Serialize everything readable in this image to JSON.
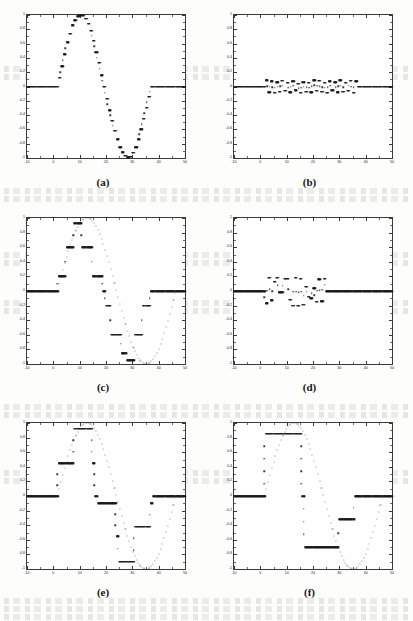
{
  "figure": {
    "kind": "multi-panel-scatter-figure",
    "panel_count": 6,
    "layout": "2 columns x 3 rows",
    "source_look": "scanned journal page, black dots on white"
  },
  "axes_common": {
    "xlabel": "",
    "ylabel": "",
    "xlim": [
      -10,
      50
    ],
    "ylim": [
      -1,
      1
    ],
    "xticks": [
      -10,
      0,
      10,
      20,
      30,
      40,
      50
    ],
    "xtick_labels": [
      "-10",
      "0",
      "10",
      "20",
      "30",
      "40",
      "50"
    ],
    "yticks": [
      1,
      0.8,
      0.6,
      0.4,
      0.2,
      0,
      -0.2,
      -0.4,
      -0.6,
      -0.8,
      -1
    ],
    "ytick_labels": [
      "1",
      "0.8",
      "0.6",
      "0.4",
      "0.2",
      "0",
      "-0.2",
      "-0.4",
      "-0.6",
      "-0.8",
      "-1"
    ],
    "grid": false,
    "legend": null,
    "marker": "dot",
    "marker_color": "#1a1a1a"
  },
  "captions": {
    "a": "(a)",
    "b": "(b)",
    "c": "(c)",
    "d": "(d)",
    "e": "(e)",
    "f": "(f)"
  },
  "chart_data": [
    {
      "id": "a",
      "type": "scatter",
      "title": "(a)",
      "xlabel": "",
      "ylabel": "",
      "xlim": [
        -10,
        50
      ],
      "ylim": [
        -1,
        1
      ],
      "grid": false,
      "description": "finely quantized sine burst, zero outside burst",
      "x": [
        -10,
        -9,
        -8,
        -7,
        -6,
        -5,
        -4,
        -3,
        -2,
        -1,
        0,
        1,
        2,
        3,
        4,
        5,
        6,
        7,
        8,
        9,
        10,
        11,
        12,
        13,
        14,
        15,
        16,
        17,
        18,
        19,
        20,
        21,
        22,
        23,
        24,
        25,
        26,
        27,
        28,
        29,
        30,
        31,
        32,
        33,
        34,
        35,
        36,
        37,
        38,
        39,
        40,
        41,
        42,
        43,
        44,
        45,
        46,
        47,
        48,
        49,
        50
      ],
      "y": [
        0,
        0,
        0,
        0,
        0,
        0,
        0,
        0,
        0,
        0,
        0,
        0,
        0.12,
        0.28,
        0.45,
        0.62,
        0.74,
        0.86,
        0.93,
        0.98,
        1.0,
        0.99,
        0.95,
        0.88,
        0.78,
        0.64,
        0.48,
        0.33,
        0.16,
        0.0,
        -0.17,
        -0.33,
        -0.48,
        -0.62,
        -0.74,
        -0.85,
        -0.92,
        -0.97,
        -0.99,
        -0.98,
        -0.93,
        -0.85,
        -0.74,
        -0.6,
        -0.45,
        -0.3,
        -0.14,
        0,
        0,
        0,
        0,
        0,
        0,
        0,
        0,
        0,
        0,
        0,
        0,
        0,
        0
      ]
    },
    {
      "id": "b",
      "type": "scatter",
      "title": "(b)",
      "xlabel": "",
      "ylabel": "",
      "xlim": [
        -10,
        50
      ],
      "ylim": [
        -1,
        1
      ],
      "grid": false,
      "description": "quantization error for (a): small oscillation within about +/-0.12, zero outside burst",
      "x": [
        -10,
        -9,
        -8,
        -7,
        -6,
        -5,
        -4,
        -3,
        -2,
        -1,
        0,
        1,
        2,
        3,
        4,
        5,
        6,
        7,
        8,
        9,
        10,
        11,
        12,
        13,
        14,
        15,
        16,
        17,
        18,
        19,
        20,
        21,
        22,
        23,
        24,
        25,
        26,
        27,
        28,
        29,
        30,
        31,
        32,
        33,
        34,
        35,
        36,
        37,
        38,
        39,
        40,
        41,
        42,
        43,
        44,
        45,
        46,
        47,
        48,
        49,
        50
      ],
      "y": [
        0,
        0,
        0,
        0,
        0,
        0,
        0,
        0,
        0,
        0,
        0,
        0,
        0.09,
        -0.08,
        0.07,
        -0.09,
        0.06,
        -0.07,
        0.08,
        -0.06,
        0.05,
        -0.08,
        0.07,
        -0.05,
        0.04,
        -0.09,
        0.06,
        -0.07,
        0.05,
        -0.08,
        0.09,
        -0.06,
        0.08,
        -0.07,
        0.05,
        -0.09,
        0.07,
        -0.05,
        0.06,
        -0.08,
        0.09,
        -0.07,
        0.05,
        -0.06,
        0.08,
        -0.09,
        0.07,
        0,
        0,
        0,
        0,
        0,
        0,
        0,
        0,
        0,
        0,
        0,
        0,
        0,
        0
      ]
    },
    {
      "id": "c",
      "type": "scatter",
      "title": "(c)",
      "xlabel": "",
      "ylabel": "",
      "xlim": [
        -10,
        50
      ],
      "ylim": [
        -1,
        1
      ],
      "grid": false,
      "description": "medium quantized sine burst, short flat runs at discrete levels",
      "x": [
        -10,
        -9,
        -8,
        -7,
        -6,
        -5,
        -4,
        -3,
        -2,
        -1,
        0,
        1,
        2,
        3,
        4,
        5,
        6,
        7,
        8,
        9,
        10,
        11,
        12,
        13,
        14,
        15,
        16,
        17,
        18,
        19,
        20,
        21,
        22,
        23,
        24,
        25,
        26,
        27,
        28,
        29,
        30,
        31,
        32,
        33,
        34,
        35,
        36,
        37,
        38,
        39,
        40,
        41,
        42,
        43,
        44,
        45,
        46,
        47,
        48,
        49,
        50
      ],
      "y": [
        0,
        0,
        0,
        0,
        0,
        0,
        0,
        0,
        0,
        0,
        0,
        0,
        0.2,
        0.2,
        0.2,
        0.6,
        0.6,
        0.6,
        0.93,
        0.93,
        0.93,
        0.6,
        0.6,
        0.6,
        0.6,
        0.2,
        0.2,
        0.2,
        0.2,
        0,
        -0.2,
        -0.2,
        -0.6,
        -0.6,
        -0.6,
        -0.6,
        -0.85,
        -0.85,
        -0.95,
        -0.95,
        -0.95,
        -0.6,
        -0.6,
        -0.6,
        -0.2,
        -0.2,
        -0.2,
        0,
        0,
        0,
        0,
        0,
        0,
        0,
        0,
        0,
        0,
        0,
        0,
        0,
        0
      ]
    },
    {
      "id": "d",
      "type": "scatter",
      "title": "(d)",
      "xlabel": "",
      "ylabel": "",
      "xlim": [
        -10,
        50
      ],
      "ylim": [
        -1,
        1
      ],
      "grid": false,
      "description": "quantization error for (c): discrete levels near +/-0.2, zero outside burst",
      "x": [
        -10,
        -9,
        -8,
        -7,
        -6,
        -5,
        -4,
        -3,
        -2,
        -1,
        0,
        1,
        2,
        3,
        4,
        5,
        6,
        7,
        8,
        9,
        10,
        11,
        12,
        13,
        14,
        15,
        16,
        17,
        18,
        19,
        20,
        21,
        22,
        23,
        24,
        25,
        26,
        27,
        28,
        29,
        30,
        31,
        32,
        33,
        34,
        35,
        36,
        37,
        38,
        39,
        40,
        41,
        42,
        43,
        44,
        45,
        46,
        47,
        48,
        49,
        50
      ],
      "y": [
        0,
        0,
        0,
        0,
        0,
        0,
        0,
        0,
        0,
        0,
        0,
        0,
        -0.17,
        0.18,
        -0.13,
        0.13,
        0.18,
        -0.02,
        -0.02,
        0.17,
        0.17,
        -0.12,
        -0.2,
        0.18,
        -0.2,
        0.17,
        -0.19,
        0.06,
        -0.08,
        -0.1,
        0.04,
        -0.15,
        0.16,
        -0.14,
        0.17,
        0,
        0,
        0,
        0,
        0,
        0,
        0,
        0,
        0,
        0,
        0,
        0,
        0,
        0,
        0,
        0,
        0,
        0,
        0,
        0,
        0,
        0,
        0,
        0,
        0,
        0
      ]
    },
    {
      "id": "e",
      "type": "scatter",
      "title": "(e)",
      "xlabel": "",
      "ylabel": "",
      "xlim": [
        -10,
        50
      ],
      "ylim": [
        -1,
        1
      ],
      "grid": false,
      "description": "coarsely quantized sine burst, long flat runs at about 0.45, 0.92, -0.1, -0.42, -0.9",
      "x": [
        -10,
        -9,
        -8,
        -7,
        -6,
        -5,
        -4,
        -3,
        -2,
        -1,
        0,
        1,
        2,
        3,
        4,
        5,
        6,
        7,
        8,
        9,
        10,
        11,
        12,
        13,
        14,
        15,
        16,
        17,
        18,
        19,
        20,
        21,
        22,
        23,
        24,
        25,
        26,
        27,
        28,
        29,
        30,
        31,
        32,
        33,
        34,
        35,
        36,
        37,
        38,
        39,
        40,
        41,
        42,
        43,
        44,
        45,
        46,
        47,
        48,
        49,
        50
      ],
      "y": [
        0,
        0,
        0,
        0,
        0,
        0,
        0,
        0,
        0,
        0,
        0,
        0,
        0.45,
        0.45,
        0.45,
        0.45,
        0.45,
        0.45,
        0.92,
        0.92,
        0.92,
        0.92,
        0.92,
        0.92,
        0.92,
        0.45,
        0.0,
        -0.1,
        -0.1,
        -0.1,
        -0.1,
        -0.1,
        -0.1,
        -0.1,
        -0.55,
        -0.9,
        -0.9,
        -0.9,
        -0.9,
        -0.9,
        -0.9,
        -0.42,
        -0.42,
        -0.42,
        -0.42,
        -0.42,
        -0.42,
        -0.1,
        0,
        0,
        0,
        0,
        0,
        0,
        0,
        0,
        0,
        0,
        0,
        0,
        0
      ]
    },
    {
      "id": "f",
      "type": "scatter",
      "title": "(f)",
      "xlabel": "",
      "ylabel": "",
      "xlim": [
        -10,
        50
      ],
      "ylim": [
        -1,
        1
      ],
      "grid": false,
      "description": "coarsest quantized sine burst, very long flat runs at about 0.85, -0.32, -0.7 and 0",
      "x": [
        -10,
        -9,
        -8,
        -7,
        -6,
        -5,
        -4,
        -3,
        -2,
        -1,
        0,
        1,
        2,
        3,
        4,
        5,
        6,
        7,
        8,
        9,
        10,
        11,
        12,
        13,
        14,
        15,
        16,
        17,
        18,
        19,
        20,
        21,
        22,
        23,
        24,
        25,
        26,
        27,
        28,
        29,
        30,
        31,
        32,
        33,
        34,
        35,
        36,
        37,
        38,
        39,
        40,
        41,
        42,
        43,
        44,
        45,
        46,
        47,
        48,
        49,
        50
      ],
      "y": [
        0,
        0,
        0,
        0,
        0,
        0,
        0,
        0,
        0,
        0,
        0,
        0,
        0.85,
        0.85,
        0.85,
        0.85,
        0.85,
        0.85,
        0.85,
        0.85,
        0.85,
        0.85,
        0.85,
        0.85,
        0.85,
        0.85,
        0.0,
        -0.7,
        -0.7,
        -0.7,
        -0.7,
        -0.7,
        -0.7,
        -0.7,
        -0.7,
        -0.7,
        -0.7,
        -0.7,
        -0.7,
        -0.7,
        -0.32,
        -0.32,
        -0.32,
        -0.32,
        -0.32,
        -0.32,
        0,
        0,
        0,
        0,
        0,
        0,
        0,
        0,
        0,
        0,
        0,
        0,
        0,
        0,
        0
      ]
    }
  ],
  "overlay_dots": {
    "note": "lighter underlying un-quantized sine samples visible as sparse dots in panels c,e,f",
    "enabled": true
  }
}
